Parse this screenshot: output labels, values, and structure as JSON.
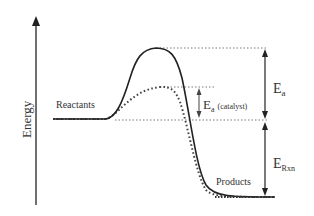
{
  "diagram": {
    "type": "energy-profile",
    "axis": {
      "label": "Energy"
    },
    "labels": {
      "reactants": "Reactants",
      "products": "Products",
      "ea_main": "E",
      "ea_sub": "a",
      "ea_cat_main": "E",
      "ea_cat_sub": "a",
      "ea_cat_note": "(catalyst)",
      "erxn_main": "E",
      "erxn_sub": "Rxn"
    },
    "curves": [
      {
        "name": "uncatalyzed",
        "style": "solid"
      },
      {
        "name": "catalyzed",
        "style": "dotted"
      }
    ],
    "colors": {
      "line": "#222222",
      "text": "#333333",
      "guide": "#555555"
    }
  }
}
